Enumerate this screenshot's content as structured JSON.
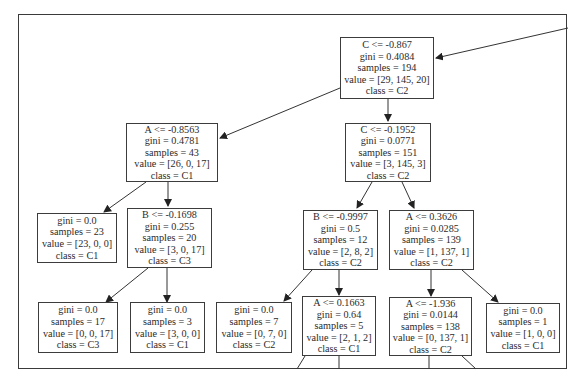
{
  "diagram": {
    "type": "decision-tree",
    "nodes": [
      {
        "id": "n0",
        "split": "C <= -0.867",
        "gini": "gini = 0.4084",
        "samples": "samples = 194",
        "value": "value = [29, 145, 20]",
        "class": "class = C2"
      },
      {
        "id": "n1",
        "split": "A <= -0.8563",
        "gini": "gini = 0.4781",
        "samples": "samples = 43",
        "value": "value = [26, 0, 17]",
        "class": "class = C1"
      },
      {
        "id": "n2",
        "split": "C <= -0.1952",
        "gini": "gini = 0.0771",
        "samples": "samples = 151",
        "value": "value = [3, 145, 3]",
        "class": "class = C2"
      },
      {
        "id": "n3",
        "split": "",
        "gini": "gini = 0.0",
        "samples": "samples = 23",
        "value": "value = [23, 0, 0]",
        "class": "class = C1"
      },
      {
        "id": "n4",
        "split": "B <= -0.1698",
        "gini": "gini = 0.255",
        "samples": "samples = 20",
        "value": "value = [3, 0, 17]",
        "class": "class = C3"
      },
      {
        "id": "n5",
        "split": "B <= -0.9997",
        "gini": "gini = 0.5",
        "samples": "samples = 12",
        "value": "value = [2, 8, 2]",
        "class": "class = C2"
      },
      {
        "id": "n6",
        "split": "A <= 0.3626",
        "gini": "gini = 0.0285",
        "samples": "samples = 139",
        "value": "value = [1, 137, 1]",
        "class": "class = C2"
      },
      {
        "id": "n7",
        "split": "",
        "gini": "gini = 0.0",
        "samples": "samples = 17",
        "value": "value = [0, 0, 17]",
        "class": "class = C3"
      },
      {
        "id": "n8",
        "split": "",
        "gini": "gini = 0.0",
        "samples": "samples = 3",
        "value": "value = [3, 0, 0]",
        "class": "class = C1"
      },
      {
        "id": "n9",
        "split": "",
        "gini": "gini = 0.0",
        "samples": "samples = 7",
        "value": "value = [0, 7, 0]",
        "class": "class = C2"
      },
      {
        "id": "n10",
        "split": "A <= 0.1663",
        "gini": "gini = 0.64",
        "samples": "samples = 5",
        "value": "value = [2, 1, 2]",
        "class": "class = C1"
      },
      {
        "id": "n11",
        "split": "A <= -1.936",
        "gini": "gini = 0.0144",
        "samples": "samples = 138",
        "value": "value = [0, 137, 1]",
        "class": "class = C2"
      },
      {
        "id": "n12",
        "split": "",
        "gini": "gini = 0.0",
        "samples": "samples = 1",
        "value": "value = [1, 0, 0]",
        "class": "class = C1"
      }
    ],
    "edges": [
      [
        "n0",
        "n1"
      ],
      [
        "n0",
        "n2"
      ],
      [
        "n1",
        "n3"
      ],
      [
        "n1",
        "n4"
      ],
      [
        "n2",
        "n5"
      ],
      [
        "n2",
        "n6"
      ],
      [
        "n4",
        "n7"
      ],
      [
        "n4",
        "n8"
      ],
      [
        "n5",
        "n9"
      ],
      [
        "n5",
        "n10"
      ],
      [
        "n6",
        "n11"
      ],
      [
        "n6",
        "n12"
      ]
    ]
  }
}
